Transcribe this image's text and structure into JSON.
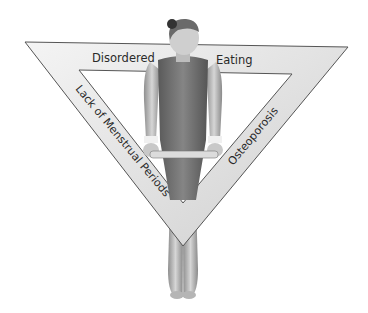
{
  "figure": {
    "sides": {
      "top_left": "Disordered",
      "top_right": "Eating",
      "left": "Lack of Menstrual Periods",
      "right": "Osteoporosis"
    },
    "colors": {
      "band_light": "#f2f2f2",
      "band_dark": "#c9c9c9",
      "band_edge": "#555555",
      "skin_light": "#d9d9d9",
      "skin_dark": "#8a8a8a",
      "leotard": "#6e6e6e",
      "hair": "#3a3a3a",
      "background": "#ffffff"
    }
  }
}
